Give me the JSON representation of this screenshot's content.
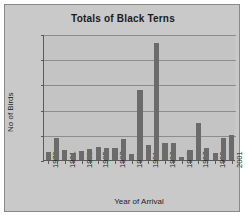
{
  "chart_data": {
    "type": "bar",
    "title": "Totals of Black Terns",
    "xlabel": "Year of Arrival",
    "ylabel": "No of Birds",
    "ylim": [
      0,
      2500
    ],
    "yticks": [
      0,
      500,
      1000,
      1500,
      2000,
      2500
    ],
    "grid": true,
    "legend": null,
    "bar_color": "#6b6b6b",
    "plot_background": "#c4c4c4",
    "figure_background": "#c9c9c9",
    "categories": [
      "1979",
      "1980",
      "1981",
      "1982",
      "1983",
      "1984",
      "1985",
      "1986",
      "1987",
      "1988",
      "1989",
      "1990",
      "1991",
      "1992",
      "1993",
      "1994",
      "1995",
      "1996",
      "1997",
      "1998",
      "1999",
      "2000",
      "2001"
    ],
    "xtick_labels": [
      "1979",
      "",
      "1981",
      "",
      "1983",
      "",
      "1985",
      "",
      "1987",
      "",
      "1989",
      "",
      "1991",
      "",
      "1993",
      "",
      "1995",
      "",
      "1997",
      "",
      "1999",
      "",
      "2001"
    ],
    "values": [
      150,
      430,
      195,
      140,
      180,
      215,
      265,
      240,
      245,
      410,
      120,
      1390,
      290,
      2330,
      330,
      340,
      60,
      190,
      730,
      245,
      140,
      430,
      500
    ]
  }
}
